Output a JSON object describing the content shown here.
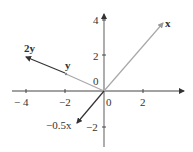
{
  "diagram": {
    "title": "",
    "axes": {
      "x_ticks": [
        {
          "value": -4,
          "label": "− 4"
        },
        {
          "value": -2,
          "label": "−2"
        },
        {
          "value": 0,
          "label": "0"
        },
        {
          "value": 2,
          "label": "2"
        }
      ],
      "y_ticks": [
        {
          "value": 4,
          "label": "4"
        },
        {
          "value": 2,
          "label": "2"
        },
        {
          "value": 0,
          "label": "0"
        },
        {
          "value": -2,
          "label": "−2"
        }
      ],
      "color": "#444444"
    },
    "vectors": [
      {
        "name": "x",
        "label": "x",
        "from": [
          0,
          0
        ],
        "to": [
          3,
          4
        ],
        "color": "#a8a8a8"
      },
      {
        "name": "y",
        "label": "y",
        "from": [
          0,
          0
        ],
        "to": [
          -2,
          1
        ],
        "color": "#a8a8a8"
      },
      {
        "name": "2y",
        "label": "2y",
        "from": [
          0,
          0
        ],
        "to": [
          -4,
          2
        ],
        "color": "#333333"
      },
      {
        "name": "-0.5x",
        "label": "−0.5x",
        "from": [
          0,
          0
        ],
        "to": [
          -1.5,
          -2
        ],
        "color": "#333333"
      }
    ]
  }
}
